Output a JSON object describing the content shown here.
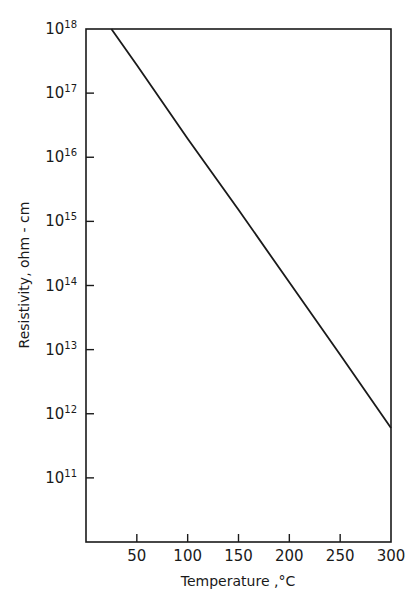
{
  "chart_data": {
    "type": "line",
    "title": "",
    "xlabel": "Temperature ,°C",
    "ylabel": "Resistivity, ohm - cm",
    "x_scale": "linear",
    "y_scale": "log",
    "xlim": [
      0,
      300
    ],
    "ylim": [
      10000000000.0,
      1e+18
    ],
    "x_ticks": [
      50,
      100,
      150,
      200,
      250,
      300
    ],
    "x_tick_labels": [
      "50",
      "100",
      "150",
      "200",
      "250",
      "300"
    ],
    "y_ticks": [
      100000000000.0,
      1000000000000.0,
      10000000000000.0,
      100000000000000.0,
      1000000000000000.0,
      1e+16,
      1e+17,
      1e+18
    ],
    "y_tick_labels": [
      {
        "base": "10",
        "exp": "11"
      },
      {
        "base": "10",
        "exp": "12"
      },
      {
        "base": "10",
        "exp": "13"
      },
      {
        "base": "10",
        "exp": "14"
      },
      {
        "base": "10",
        "exp": "15"
      },
      {
        "base": "10",
        "exp": "16"
      },
      {
        "base": "10",
        "exp": "17"
      },
      {
        "base": "10",
        "exp": "18"
      }
    ],
    "grid": false,
    "legend": null,
    "series": [
      {
        "name": "Resistivity",
        "x": [
          25,
          50,
          100,
          150,
          200,
          250,
          300
        ],
        "log10_y": [
          18.0,
          17.44,
          16.29,
          15.18,
          14.05,
          12.92,
          11.78
        ],
        "y": [
          1e+18,
          2.75e+17,
          1.95e+16,
          1500000000000000.0,
          110000000000000.0,
          8300000000000.0,
          600000000000.0
        ],
        "color": "#1a1a1a"
      }
    ]
  },
  "labels": {
    "xlabel": "Temperature ,°C",
    "ylabel": "Resistivity, ohm - cm"
  },
  "colors": {
    "ink": "#1a1a1a",
    "background": "#ffffff"
  }
}
